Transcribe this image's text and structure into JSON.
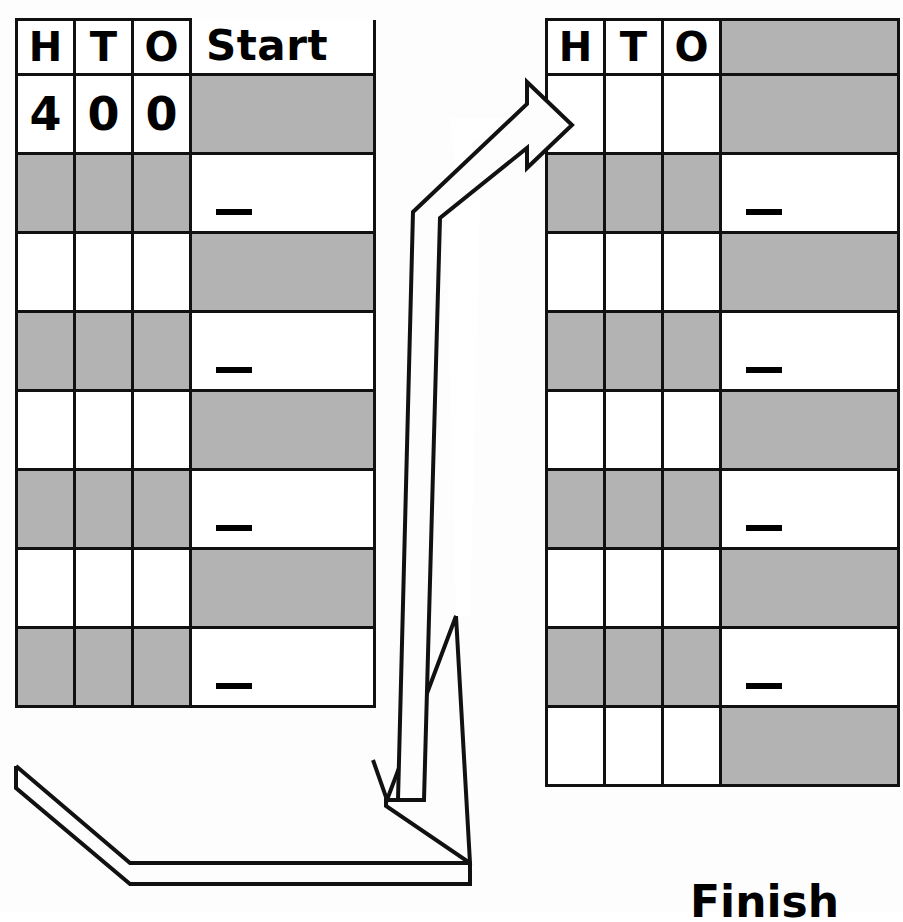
{
  "page": {
    "background_color": "#fdfdfd",
    "ink_color": "#111111",
    "shade_color": "#b3b3b3"
  },
  "left_table": {
    "name": "start-place-value-chart",
    "header": {
      "columns": [
        "H",
        "T",
        "O"
      ],
      "wide_label": "Start"
    },
    "rows": [
      {
        "cells": [
          "4",
          "0",
          "0"
        ],
        "shaded": false,
        "wide_shaded": true,
        "wide_mark": ""
      },
      {
        "cells": [
          "",
          "",
          ""
        ],
        "shaded": true,
        "wide_shaded": false,
        "wide_mark": "dash"
      },
      {
        "cells": [
          "",
          "",
          ""
        ],
        "shaded": false,
        "wide_shaded": true,
        "wide_mark": ""
      },
      {
        "cells": [
          "",
          "",
          ""
        ],
        "shaded": true,
        "wide_shaded": false,
        "wide_mark": "dash"
      },
      {
        "cells": [
          "",
          "",
          ""
        ],
        "shaded": false,
        "wide_shaded": true,
        "wide_mark": ""
      },
      {
        "cells": [
          "",
          "",
          ""
        ],
        "shaded": true,
        "wide_shaded": false,
        "wide_mark": "dash"
      },
      {
        "cells": [
          "",
          "",
          ""
        ],
        "shaded": false,
        "wide_shaded": true,
        "wide_mark": ""
      },
      {
        "cells": [
          "",
          "",
          ""
        ],
        "shaded": true,
        "wide_shaded": false,
        "wide_mark": "dash"
      }
    ]
  },
  "right_table": {
    "name": "finish-place-value-chart",
    "header": {
      "columns": [
        "H",
        "T",
        "O"
      ],
      "wide_label": ""
    },
    "rows": [
      {
        "cells": [
          "",
          "",
          ""
        ],
        "shaded": false,
        "wide_shaded": true,
        "wide_mark": ""
      },
      {
        "cells": [
          "",
          "",
          ""
        ],
        "shaded": true,
        "wide_shaded": false,
        "wide_mark": "dash"
      },
      {
        "cells": [
          "",
          "",
          ""
        ],
        "shaded": false,
        "wide_shaded": true,
        "wide_mark": ""
      },
      {
        "cells": [
          "",
          "",
          ""
        ],
        "shaded": true,
        "wide_shaded": false,
        "wide_mark": "dash"
      },
      {
        "cells": [
          "",
          "",
          ""
        ],
        "shaded": false,
        "wide_shaded": true,
        "wide_mark": ""
      },
      {
        "cells": [
          "",
          "",
          ""
        ],
        "shaded": true,
        "wide_shaded": false,
        "wide_mark": "dash"
      },
      {
        "cells": [
          "",
          "",
          ""
        ],
        "shaded": false,
        "wide_shaded": true,
        "wide_mark": ""
      },
      {
        "cells": [
          "",
          "",
          ""
        ],
        "shaded": true,
        "wide_shaded": false,
        "wide_mark": "dash"
      },
      {
        "cells": [
          "",
          "",
          ""
        ],
        "shaded": false,
        "wide_shaded": true,
        "wide_mark": ""
      }
    ]
  },
  "captions": {
    "finish": "Finish"
  },
  "arrow": {
    "name": "loop-arrow",
    "description": "curved block arrow from bottom-left of start chart looping up to the right chart"
  }
}
